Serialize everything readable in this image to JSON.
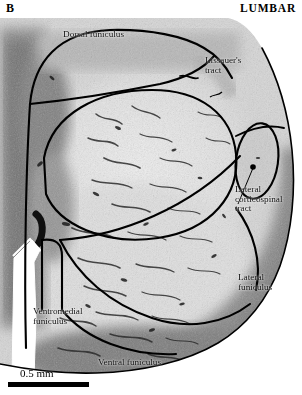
{
  "figure": {
    "panel_letter": "B",
    "region_title": "LUMBAR",
    "modality": "histological-section",
    "stain_appearance": "grayscale-myelin-stain"
  },
  "annotations": {
    "dorsal_funiculus": "Dorsal funiculus",
    "lissauers_tract": "Lissauer's\ntract",
    "lateral_corticospinal_tract": "Lateral\ncorticospinal\ntract",
    "lateral_funiculus": "Lateral\nfuniculus",
    "ventromedial_funiculus": "Ventromedial\nfuniculus",
    "ventral_funiculus": "Ventral funiculus"
  },
  "scale": {
    "label": "0.5 mm",
    "bar_length_px": 81
  },
  "colors": {
    "ink": "#000000",
    "label_text": "#111111",
    "background": "#ffffff",
    "tissue_light": "#e9e9e9",
    "tissue_mid": "#c2c2c2",
    "tissue_dark": "#6e6e6e",
    "outline": "#000000"
  }
}
